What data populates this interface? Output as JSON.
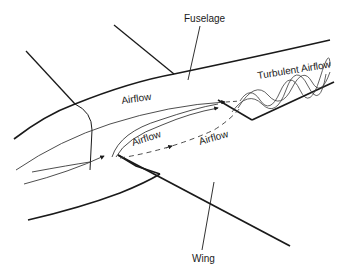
{
  "diagram": {
    "type": "aircraft wing-root airflow illustration",
    "labels": {
      "fuselage": "Fuselage",
      "wing": "Wing",
      "turbulent_airflow": "Turbulent Airflow",
      "airflow_top": "Airflow",
      "airflow_upper_wing": "Airflow",
      "airflow_lower_wing": "Airflow"
    },
    "colors": {
      "stroke": "#1a1a1a",
      "flow": "#3a3a3a",
      "background": "#ffffff"
    }
  }
}
